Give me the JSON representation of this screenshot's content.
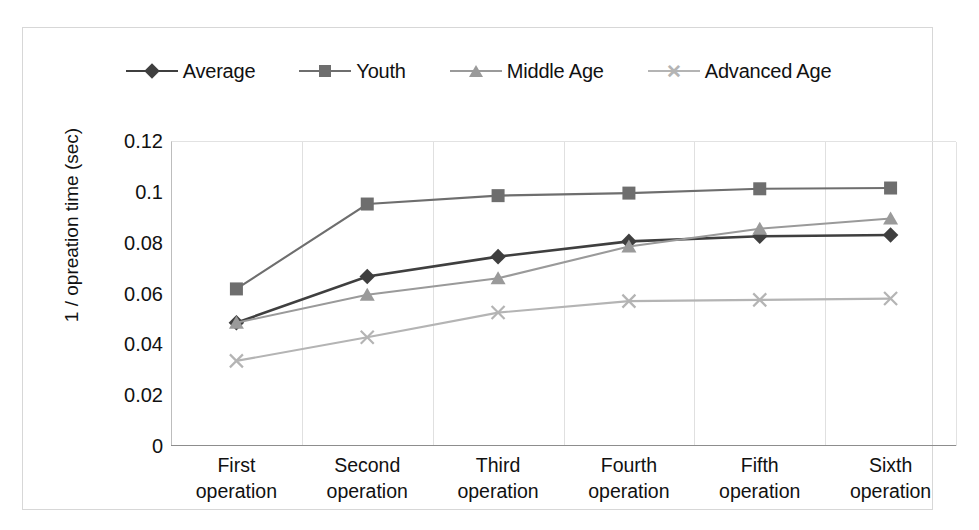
{
  "chart_data": {
    "type": "line",
    "title": "",
    "xlabel": "",
    "ylabel": "1 / opreation time (sec)",
    "categories": [
      "First operation",
      "Second operation",
      "Third operation",
      "Fourth operation",
      "Fifth operation",
      "Sixth operation"
    ],
    "category_lines": [
      [
        "First",
        "operation"
      ],
      [
        "Second",
        "operation"
      ],
      [
        "Third",
        "operation"
      ],
      [
        "Fourth",
        "operation"
      ],
      [
        "Fifth",
        "operation"
      ],
      [
        "Sixth",
        "operation"
      ]
    ],
    "ylim": [
      0,
      0.12
    ],
    "yticks": [
      "0.12",
      "0.1",
      "0.08",
      "0.06",
      "0.04",
      "0.02",
      "0"
    ],
    "ytick_values": [
      0.12,
      0.1,
      0.08,
      0.06,
      0.04,
      0.02,
      0
    ],
    "grid": "vertical",
    "legend_position": "top-center",
    "series": [
      {
        "name": "Average",
        "marker": "diamond",
        "color": "#3f3f3f",
        "values": [
          0.0485,
          0.0667,
          0.0745,
          0.0805,
          0.0825,
          0.083
        ]
      },
      {
        "name": "Youth",
        "marker": "square",
        "color": "#6e6e6e",
        "values": [
          0.0618,
          0.0952,
          0.0985,
          0.0995,
          0.1012,
          0.1015
        ]
      },
      {
        "name": "Middle Age",
        "marker": "triangle",
        "color": "#9a9a9a",
        "values": [
          0.0485,
          0.0595,
          0.066,
          0.0785,
          0.0855,
          0.0895
        ]
      },
      {
        "name": "Advanced Age",
        "marker": "x",
        "color": "#b4b4b4",
        "values": [
          0.0335,
          0.0428,
          0.0525,
          0.057,
          0.0575,
          0.058
        ]
      }
    ]
  },
  "legend": {
    "items": [
      {
        "label": "Average"
      },
      {
        "label": "Youth"
      },
      {
        "label": "Middle Age"
      },
      {
        "label": "Advanced Age"
      }
    ]
  }
}
